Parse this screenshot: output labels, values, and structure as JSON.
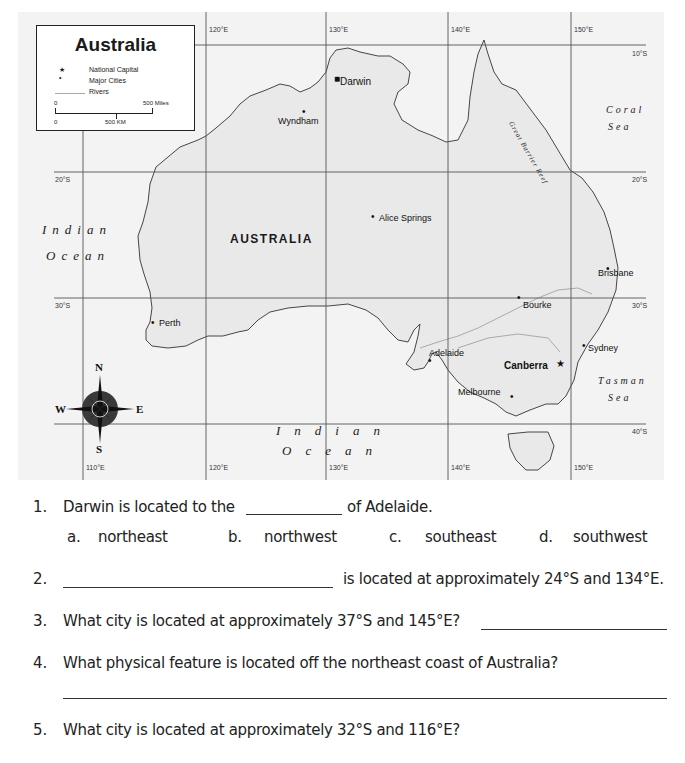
{
  "map": {
    "legend": {
      "title": "Australia",
      "items": [
        {
          "symbol": "★",
          "label": "National Capital",
          "icon": "star-icon"
        },
        {
          "symbol": "•",
          "label": "Major Cities",
          "icon": "dot-icon"
        },
        {
          "symbol": "line",
          "label": "Rivers",
          "icon": "river-line-icon"
        }
      ],
      "scale": {
        "top_start": "0",
        "top_end": "500 Miles",
        "bottom_start": "0",
        "bottom_mid": "500 KM"
      }
    },
    "longitude_ticks_top": [
      "120°E",
      "130°E",
      "140°E",
      "150°E"
    ],
    "longitude_ticks_bottom": [
      "110°E",
      "120°E",
      "130°E",
      "140°E",
      "150°E"
    ],
    "latitude_ticks": [
      "10°S",
      "20°S",
      "20°S",
      "30°S",
      "30°S",
      "40°S"
    ],
    "country_label": "AUSTRALIA",
    "cities": [
      {
        "name": "Darwin"
      },
      {
        "name": "Wyndham"
      },
      {
        "name": "Alice Springs"
      },
      {
        "name": "Brisbane"
      },
      {
        "name": "Bourke"
      },
      {
        "name": "Perth"
      },
      {
        "name": "Adelaide"
      },
      {
        "name": "Sydney"
      },
      {
        "name": "Melbourne"
      },
      {
        "name": "Canberra",
        "capital": true
      }
    ],
    "water_bodies": {
      "indian_ocean_west_1": "Indian",
      "indian_ocean_west_2": "Ocean",
      "indian_ocean_south_1": "Indian",
      "indian_ocean_south_2": "Ocean",
      "coral_sea_1": "Coral",
      "coral_sea_2": "Sea",
      "tasman_sea_1": "Tasman",
      "tasman_sea_2": "Sea",
      "reef": "Great Barrier Reef"
    },
    "compass": {
      "n": "N",
      "s": "S",
      "e": "E",
      "w": "W"
    }
  },
  "questions": [
    {
      "number": "1.",
      "text_before": "Darwin is located to the",
      "text_after": "of Adelaide.",
      "options": [
        {
          "letter": "a.",
          "text": "northeast"
        },
        {
          "letter": "b.",
          "text": "northwest"
        },
        {
          "letter": "c.",
          "text": "southeast"
        },
        {
          "letter": "d.",
          "text": "southwest"
        }
      ]
    },
    {
      "number": "2.",
      "text_after": "is located at approximately 24°S and 134°E."
    },
    {
      "number": "3.",
      "text": "What city is located at approximately 37°S and 145°E?"
    },
    {
      "number": "4.",
      "text": "What physical feature is located off the northeast coast of Australia?"
    },
    {
      "number": "5.",
      "text": "What city is located at approximately 32°S and 116°E?"
    }
  ]
}
